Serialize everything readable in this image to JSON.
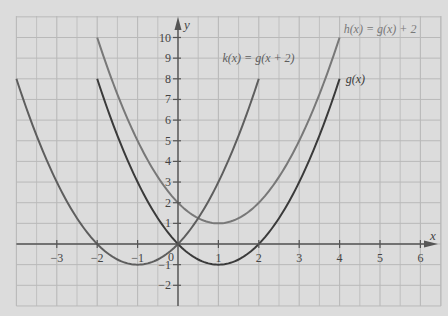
{
  "chart_data": {
    "type": "line",
    "title": "",
    "xlabel": "x",
    "ylabel": "y",
    "xlim": [
      -4,
      6.5
    ],
    "ylim": [
      -3,
      11
    ],
    "grid": true,
    "grid_step": {
      "x": 0.5,
      "y": 1
    },
    "x_ticks": [
      -3,
      -2,
      -1,
      1,
      2,
      3,
      4,
      5,
      6
    ],
    "x_tick_labels": [
      "−3",
      "−2",
      "−1",
      "1",
      "2",
      "3",
      "4",
      "5",
      "6"
    ],
    "y_ticks": [
      -2,
      -1,
      1,
      2,
      3,
      4,
      5,
      6,
      7,
      8,
      9,
      10
    ],
    "y_tick_labels": [
      "−2",
      "−1",
      "1",
      "2",
      "3",
      "4",
      "5",
      "6",
      "7",
      "8",
      "9",
      "10"
    ],
    "origin_label": "0",
    "series": [
      {
        "name": "g(x)",
        "label": "g(x)",
        "formula": "(x-1)^2 - 1",
        "domain": [
          -2,
          4
        ],
        "color": "#3a3a3a",
        "label_pos": [
          4.15,
          8
        ],
        "x": [
          -2,
          -1,
          0,
          1,
          2,
          3,
          4
        ],
        "values": [
          8,
          3,
          0,
          -1,
          0,
          3,
          8
        ]
      },
      {
        "name": "h(x)",
        "label": "h(x) = g(x) + 2",
        "formula": "(x-1)^2 + 1",
        "domain": [
          -2,
          4
        ],
        "color": "#787878",
        "label_pos": [
          4.1,
          10.4
        ],
        "x": [
          -2,
          -1,
          0,
          1,
          2,
          3,
          4
        ],
        "values": [
          10,
          5,
          2,
          1,
          2,
          5,
          10
        ]
      },
      {
        "name": "k(x)",
        "label": "k(x) = g(x + 2)",
        "formula": "(x+1)^2 - 1",
        "domain": [
          -4,
          2
        ],
        "color": "#5e5e5e",
        "label_pos": [
          1.1,
          9.0
        ],
        "x": [
          -4,
          -3,
          -2,
          -1,
          0,
          1,
          2
        ],
        "values": [
          8,
          3,
          0,
          -1,
          0,
          3,
          8
        ]
      }
    ],
    "colors": {
      "background": "#dcdcdc",
      "grid": "#b9b9b9",
      "axis": "#555555",
      "tick_text": "#444444"
    }
  }
}
